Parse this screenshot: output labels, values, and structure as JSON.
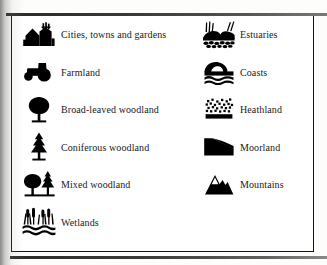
{
  "legend": {
    "columns": [
      {
        "name": "left-column",
        "items": [
          {
            "icon": "cities-towns-gardens-icon",
            "label": "Cities, towns and gardens"
          },
          {
            "icon": "farmland-tractor-icon",
            "label": "Farmland"
          },
          {
            "icon": "broad-leaved-tree-icon",
            "label": "Broad-leaved woodland"
          },
          {
            "icon": "coniferous-tree-icon",
            "label": "Coniferous woodland"
          },
          {
            "icon": "mixed-woodland-icon",
            "label": "Mixed woodland"
          },
          {
            "icon": "wetlands-reeds-icon",
            "label": "Wetlands"
          }
        ]
      },
      {
        "name": "right-column",
        "items": [
          {
            "icon": "estuaries-icon",
            "label": "Estuaries"
          },
          {
            "icon": "coasts-wave-icon",
            "label": "Coasts"
          },
          {
            "icon": "heathland-icon",
            "label": "Heathland"
          },
          {
            "icon": "moorland-icon",
            "label": "Moorland"
          },
          {
            "icon": "mountains-icon",
            "label": "Mountains"
          }
        ]
      }
    ]
  },
  "style": {
    "ink_color": "#000000",
    "text_color": "#1a1a1a",
    "paper_color": "#ffffff",
    "frame_color": "#111111"
  }
}
